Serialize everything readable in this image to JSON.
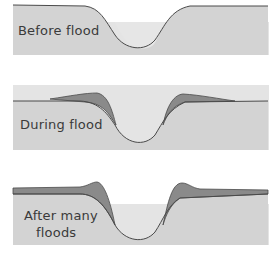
{
  "diagram": {
    "title": "",
    "colors": {
      "ground": "#d3d3d3",
      "water": "#e3e3e3",
      "deposit": "#8a8a8a",
      "outline": "#4a4a4a",
      "background": "#ffffff"
    },
    "panels": [
      {
        "id": "before",
        "label": "Before flood"
      },
      {
        "id": "during",
        "label": "During flood"
      },
      {
        "id": "after",
        "label_line1": "After many",
        "label_line2": "floods"
      }
    ]
  }
}
